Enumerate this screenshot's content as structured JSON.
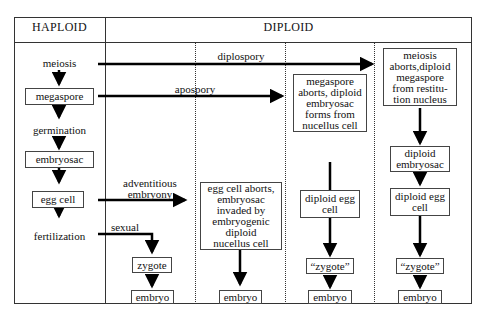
{
  "header": {
    "haploid": "HAPLOID",
    "diploid": "DIPLOID"
  },
  "haploid_column": {
    "steps": [
      {
        "label": "meiosis",
        "boxed": false
      },
      {
        "label": "megaspore",
        "boxed": true
      },
      {
        "label": "germination",
        "boxed": false
      },
      {
        "label": "embryosac",
        "boxed": true
      },
      {
        "label": "egg cell",
        "boxed": true
      },
      {
        "label": "fertilization",
        "boxed": false
      }
    ]
  },
  "pathways": {
    "diplospory": "diplospory",
    "apospory": "apospory",
    "adventitious": "adventitious\nembryony",
    "sexual": "sexual"
  },
  "sexual_column": {
    "zygote": "zygote",
    "embryo": "embryo"
  },
  "adventitious_column": {
    "box": "egg cell aborts,\nembryosac\ninvaded by\nembryogenic\ndiploid\nnucellus cell",
    "embryo": "embryo"
  },
  "apospory_column": {
    "box": "megaspore\naborts, diploid\nembryosac\nforms from\nnucellus cell",
    "egg": "diploid egg\ncell",
    "zygote": "“zygote”",
    "embryo": "embryo"
  },
  "diplospory_column": {
    "box": "meiosis\naborts,diploid\nmegaspore\nfrom restitu-\ntion nucleus",
    "embryosac": "diploid\nembryosac",
    "egg": "diploid egg\ncell",
    "zygote": "“zygote”",
    "embryo": "embryo"
  }
}
